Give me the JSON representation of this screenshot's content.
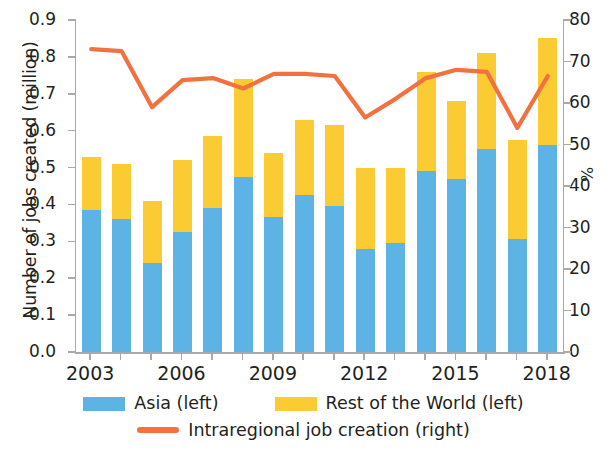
{
  "chart_data": {
    "type": "bar",
    "title": "",
    "subtitle": "",
    "xlabel": "",
    "ylabel": "Number of jobs created (million)",
    "ylabel_right": "%",
    "grid": false,
    "legend_position": "bottom",
    "categories": [
      "2003",
      "2004",
      "2005",
      "2006",
      "2007",
      "2008",
      "2009",
      "2010",
      "2011",
      "2012",
      "2013",
      "2014",
      "2015",
      "2016",
      "2017",
      "2018"
    ],
    "xtick_labels": [
      "2003",
      "2006",
      "2009",
      "2012",
      "2015",
      "2018"
    ],
    "ylim": [
      0.0,
      0.9
    ],
    "ytick_labels": [
      "0.0",
      "0.1",
      "0.2",
      "0.3",
      "0.4",
      "0.5",
      "0.6",
      "0.7",
      "0.8",
      "0.9"
    ],
    "ytick_values": [
      0.0,
      0.1,
      0.2,
      0.3,
      0.4,
      0.5,
      0.6,
      0.7,
      0.8,
      0.9
    ],
    "ylim_right": [
      0,
      80
    ],
    "ytick_labels_right": [
      "0",
      "10",
      "20",
      "30",
      "40",
      "50",
      "60",
      "70",
      "80"
    ],
    "ytick_values_right": [
      0,
      10,
      20,
      30,
      40,
      50,
      60,
      70,
      80
    ],
    "stacked": true,
    "series": [
      {
        "name": "Asia (left)",
        "type": "bar",
        "axis": "left",
        "color": "#5cb3e4",
        "values": [
          0.385,
          0.36,
          0.24,
          0.325,
          0.39,
          0.475,
          0.365,
          0.425,
          0.395,
          0.28,
          0.295,
          0.49,
          0.47,
          0.55,
          0.305,
          0.56
        ]
      },
      {
        "name": "Rest of the World (left)",
        "type": "bar",
        "axis": "left",
        "color": "#fbcb34",
        "values": [
          0.145,
          0.15,
          0.17,
          0.195,
          0.195,
          0.265,
          0.175,
          0.205,
          0.22,
          0.22,
          0.205,
          0.27,
          0.21,
          0.26,
          0.27,
          0.29
        ]
      },
      {
        "name": "Intraregional job creation (right)",
        "type": "line",
        "axis": "right",
        "color": "#f2713f",
        "values": [
          73.0,
          72.5,
          59.0,
          65.5,
          66.0,
          63.5,
          67.0,
          67.0,
          66.5,
          56.5,
          61.0,
          66.0,
          68.0,
          67.5,
          54.0,
          66.5
        ]
      }
    ],
    "totals": [
      0.53,
      0.51,
      0.41,
      0.52,
      0.585,
      0.74,
      0.54,
      0.63,
      0.615,
      0.5,
      0.5,
      0.76,
      0.68,
      0.81,
      0.575,
      0.85
    ]
  },
  "legend": {
    "asia_label": "Asia (left)",
    "row_label": "Rest of the World (left)",
    "line_label": "Intraregional job creation (right)"
  },
  "axes": {
    "left_title": "Number of jobs created (million)",
    "right_title": "%"
  },
  "colors": {
    "asia": "#5cb3e4",
    "rest_of_world": "#fbcb34",
    "line": "#f2713f",
    "axis": "#a7a9ac",
    "text": "#231f20"
  }
}
